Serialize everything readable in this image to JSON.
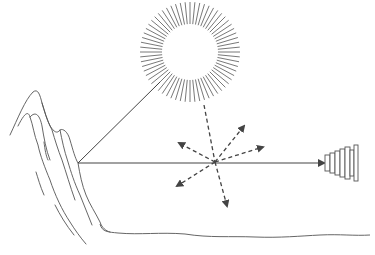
{
  "diagram": {
    "colors": {
      "ink": "#444444",
      "background": "#ffffff"
    },
    "elements": {
      "sun": {
        "center": [
          190,
          52
        ],
        "radius": 24,
        "ray_count": 64,
        "ray_inner": 28,
        "ray_outer": 50
      },
      "mountain": {
        "base_point": [
          78,
          163
        ]
      },
      "scatter_point": {
        "center": [
          215,
          162
        ]
      },
      "observer": {
        "type": "telescope",
        "position": [
          330,
          163
        ]
      },
      "incident_line_sun_to_mountain": {
        "from": [
          160,
          82
        ],
        "to": [
          78,
          163
        ],
        "style": "solid"
      },
      "line_mountain_to_observer": {
        "from": [
          78,
          163
        ],
        "to": [
          325,
          163
        ],
        "style": "solid",
        "arrow": true
      },
      "incident_dashed_sun_to_scatter": {
        "from": [
          204,
          105
        ],
        "to": [
          215,
          162
        ],
        "style": "dashed"
      },
      "scattered_arrows": [
        {
          "to": [
            244,
            126
          ],
          "direction": "up-right"
        },
        {
          "to": [
            263,
            147
          ],
          "direction": "right"
        },
        {
          "to": [
            179,
            143
          ],
          "direction": "up-left"
        },
        {
          "to": [
            177,
            186
          ],
          "direction": "down-left"
        },
        {
          "to": [
            227,
            206
          ],
          "direction": "down"
        }
      ],
      "ground_line": {
        "from": [
          100,
          230
        ],
        "to": [
          370,
          236
        ]
      }
    }
  }
}
